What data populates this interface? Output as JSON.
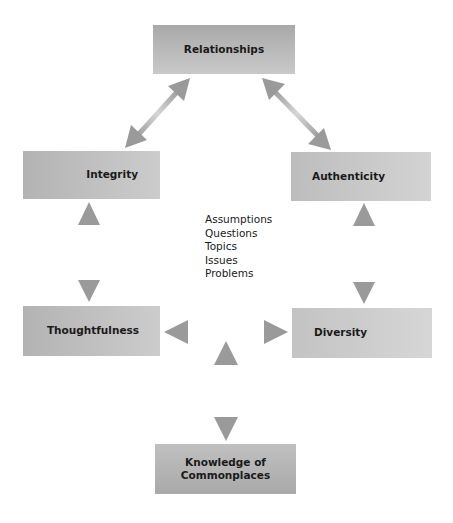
{
  "diagram": {
    "nodes": {
      "relationships": "Relationships",
      "integrity": "Integrity",
      "authenticity": "Authenticity",
      "thoughtfulness": "Thoughtfulness",
      "diversity": "Diversity",
      "knowledge_line1": "Knowledge of",
      "knowledge_line2": "Commonplaces"
    },
    "center_items": [
      "Assumptions",
      "Questions",
      "Topics",
      "Issues",
      "Problems"
    ],
    "edges": [
      {
        "from": "Relationships",
        "to": "Integrity",
        "type": "bidirectional"
      },
      {
        "from": "Relationships",
        "to": "Authenticity",
        "type": "bidirectional"
      },
      {
        "from": "Integrity",
        "to": "Thoughtfulness",
        "type": "bidirectional"
      },
      {
        "from": "Authenticity",
        "to": "Diversity",
        "type": "bidirectional"
      },
      {
        "from": "Thoughtfulness",
        "to": "Diversity",
        "type": "bidirectional"
      },
      {
        "from": "Thoughtfulness-Diversity link",
        "to": "Knowledge of Commonplaces",
        "type": "bidirectional"
      }
    ],
    "colors": {
      "box_dark": "#a9a9a9",
      "box_light": "#d3d3d3",
      "arrow": "#9a9a9a",
      "arrow_light": "#d8d8d8",
      "text": "#1a1a1a"
    }
  }
}
